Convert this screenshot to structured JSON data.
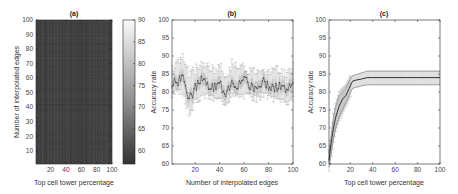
{
  "chart_data": [
    {
      "panel": "a",
      "type": "heatmap",
      "title": "(a)",
      "xlabel": "Top cell tower percentage",
      "ylabel": "Number of interpolated edges",
      "x_ticks": [
        "20",
        "40",
        "60",
        "80",
        "100"
      ],
      "y_ticks": [
        "10",
        "20",
        "30",
        "40",
        "50",
        "60",
        "70",
        "80",
        "90",
        "100"
      ],
      "xlim": [
        1,
        100
      ],
      "ylim": [
        1,
        100
      ],
      "colorbar": {
        "ticks": [
          "60",
          "65",
          "70",
          "75",
          "80",
          "85",
          "90"
        ],
        "range": [
          57,
          90
        ],
        "colormap": "gray"
      },
      "value_note": "Mostly dark (~60-63) uniform noisy field with fine vertical/horizontal streaks"
    },
    {
      "panel": "b",
      "type": "line",
      "title": "(b)",
      "xlabel": "Number of interpolated edges",
      "ylabel": "Accuracy rate",
      "x_ticks": [
        "20",
        "40",
        "60",
        "80",
        "100"
      ],
      "y_ticks": [
        "60",
        "65",
        "70",
        "75",
        "80",
        "85",
        "90",
        "95",
        "100"
      ],
      "xlim": [
        1,
        100
      ],
      "ylim": [
        60,
        100
      ],
      "grid": false,
      "series": [
        {
          "name": "mean accuracy with error bars",
          "x": [
            1,
            5,
            10,
            15,
            20,
            25,
            30,
            35,
            40,
            45,
            50,
            55,
            60,
            65,
            70,
            75,
            80,
            85,
            90,
            95,
            100
          ],
          "values": [
            82,
            83,
            84,
            78,
            81,
            83,
            82,
            81,
            82,
            80,
            83,
            82,
            83,
            82,
            81,
            83,
            82,
            81,
            82,
            80,
            83
          ],
          "err_low": [
            79,
            80,
            80,
            74,
            77,
            79,
            79,
            78,
            78,
            77,
            79,
            79,
            79,
            79,
            78,
            79,
            79,
            78,
            78,
            77,
            79
          ],
          "err_high": [
            86,
            88,
            90,
            85,
            86,
            88,
            87,
            86,
            87,
            85,
            88,
            86,
            87,
            86,
            86,
            87,
            86,
            86,
            86,
            85,
            87
          ]
        }
      ]
    },
    {
      "panel": "c",
      "type": "line",
      "title": "(c)",
      "xlabel": "Top cell tower percentage",
      "ylabel": "Accuracy rate",
      "x_ticks": [
        "20",
        "40",
        "60",
        "80",
        "100"
      ],
      "y_ticks": [
        "60",
        "65",
        "70",
        "75",
        "80",
        "85",
        "90",
        "95",
        "100"
      ],
      "xlim": [
        1,
        100
      ],
      "ylim": [
        60,
        100
      ],
      "grid": false,
      "series": [
        {
          "name": "mean accuracy",
          "x": [
            1,
            3,
            5,
            7,
            10,
            13,
            16,
            19,
            22,
            25,
            30,
            35,
            40,
            50,
            60,
            70,
            80,
            90,
            100
          ],
          "values": [
            61,
            66,
            70,
            73,
            76,
            78,
            79,
            81,
            83,
            83.3,
            83.6,
            84,
            84,
            84,
            84,
            84,
            84,
            84,
            84
          ],
          "band_low": [
            59,
            63,
            67,
            70,
            73,
            75,
            77,
            79,
            81,
            81.3,
            81.7,
            82,
            82,
            82,
            82,
            82,
            82,
            82,
            82
          ],
          "band_high": [
            63,
            68,
            73,
            76,
            79,
            80,
            81,
            83,
            84.5,
            84.8,
            85.3,
            85.8,
            85.8,
            85.8,
            85.8,
            85.8,
            85.8,
            85.8,
            85.8
          ]
        }
      ]
    }
  ]
}
